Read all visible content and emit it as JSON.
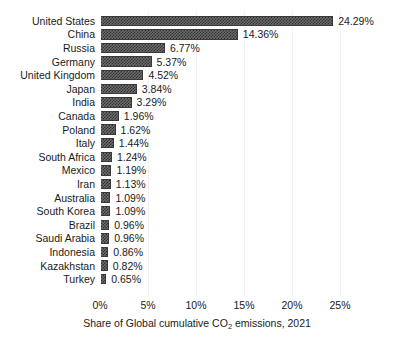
{
  "chart_data": {
    "type": "bar",
    "orientation": "horizontal",
    "title": "",
    "xlabel": "Share of Global cumulative CO2 emissions, 2021",
    "xlabel_parts": {
      "before": "Share of Global cumulative CO",
      "sub": "2",
      "after": " emissions, 2021"
    },
    "ylabel": "",
    "categories": [
      "United States",
      "China",
      "Russia",
      "Germany",
      "United Kingdom",
      "Japan",
      "India",
      "Canada",
      "Poland",
      "Italy",
      "South Africa",
      "Mexico",
      "Iran",
      "Australia",
      "South Korea",
      "Brazil",
      "Saudi Arabia",
      "Indonesia",
      "Kazakhstan",
      "Turkey"
    ],
    "values": [
      24.29,
      14.36,
      6.77,
      5.37,
      4.52,
      3.84,
      3.29,
      1.96,
      1.62,
      1.44,
      1.24,
      1.19,
      1.13,
      1.09,
      1.09,
      0.96,
      0.96,
      0.86,
      0.82,
      0.65
    ],
    "value_labels": [
      "24.29%",
      "14.36%",
      "6.77%",
      "5.37%",
      "4.52%",
      "3.84%",
      "3.29%",
      "1.96%",
      "1.62%",
      "1.44%",
      "1.24%",
      "1.19%",
      "1.13%",
      "1.09%",
      "1.09%",
      "0.96%",
      "0.96%",
      "0.86%",
      "0.82%",
      "0.65%"
    ],
    "xlim": [
      0,
      25
    ],
    "xticks": [
      0,
      5,
      10,
      15,
      20,
      25
    ],
    "xtick_labels": [
      "0%",
      "5%",
      "10%",
      "15%",
      "20%",
      "25%"
    ],
    "grid": "vertical-only",
    "legend": "none",
    "colors": {
      "bar_fill": "#6e6e6e",
      "bar_hatch": "#2e2e2e",
      "bar_edge": "#3a3a3a",
      "gridline": "#f2f2f2",
      "text": "#1a1a1a",
      "background": "#ffffff"
    }
  }
}
